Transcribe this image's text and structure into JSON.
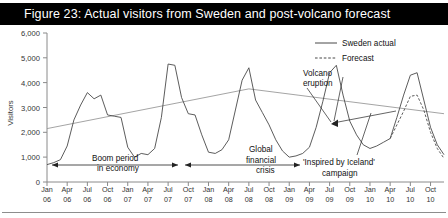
{
  "figure": {
    "title": "Figure 23: Actual visitors from Sweden and post-volcano forecast"
  },
  "chart_data": {
    "type": "line",
    "title": "Figure 23: Actual visitors from Sweden and post-volcano forecast",
    "xlabel": "",
    "ylabel": "Visitors",
    "ylim": [
      0,
      6000
    ],
    "yticks": [
      "0",
      "1,000",
      "2,000",
      "3,000",
      "4,000",
      "5,000",
      "6,000"
    ],
    "ytick_values": [
      0,
      1000,
      2000,
      3000,
      4000,
      5000,
      6000
    ],
    "grid": false,
    "legend_position": "top-right",
    "legend": [
      {
        "name": "Sweden actual",
        "style": "solid"
      },
      {
        "name": "Forecast",
        "style": "dashed"
      }
    ],
    "xtick_labels": [
      {
        "month": "Jan",
        "year": "06"
      },
      {
        "month": "Apr",
        "year": "06"
      },
      {
        "month": "Jul",
        "year": "06"
      },
      {
        "month": "Oct",
        "year": "06"
      },
      {
        "month": "Jan",
        "year": "07"
      },
      {
        "month": "Apr",
        "year": "07"
      },
      {
        "month": "Jul",
        "year": "07"
      },
      {
        "month": "Oct",
        "year": "07"
      },
      {
        "month": "Jan",
        "year": "08"
      },
      {
        "month": "Apr",
        "year": "08"
      },
      {
        "month": "Jul",
        "year": "08"
      },
      {
        "month": "Oct",
        "year": "08"
      },
      {
        "month": "Jan",
        "year": "09"
      },
      {
        "month": "Apr",
        "year": "09"
      },
      {
        "month": "Jul",
        "year": "09"
      },
      {
        "month": "Oct",
        "year": "09"
      },
      {
        "month": "Jan",
        "year": "10"
      },
      {
        "month": "Apr",
        "year": "10"
      },
      {
        "month": "Jul",
        "year": "10"
      },
      {
        "month": "Oct",
        "year": "10"
      }
    ],
    "x_start": "Jan 06",
    "x_end": "Dec 10",
    "series": [
      {
        "name": "Sweden actual",
        "style": "solid",
        "x": [
          "Jan 06",
          "Feb 06",
          "Mar 06",
          "Apr 06",
          "May 06",
          "Jun 06",
          "Jul 06",
          "Aug 06",
          "Sep 06",
          "Oct 06",
          "Nov 06",
          "Dec 06",
          "Jan 07",
          "Feb 07",
          "Mar 07",
          "Apr 07",
          "May 07",
          "Jun 07",
          "Jul 07",
          "Aug 07",
          "Sep 07",
          "Oct 07",
          "Nov 07",
          "Dec 07",
          "Jan 08",
          "Feb 08",
          "Mar 08",
          "Apr 08",
          "May 08",
          "Jun 08",
          "Jul 08",
          "Aug 08",
          "Sep 08",
          "Oct 08",
          "Nov 08",
          "Dec 08",
          "Jan 09",
          "Feb 09",
          "Mar 09",
          "Apr 09",
          "May 09",
          "Jun 09",
          "Jul 09",
          "Aug 09",
          "Sep 09",
          "Oct 09",
          "Nov 09",
          "Dec 09",
          "Jan 10",
          "Feb 10",
          "Mar 10",
          "Apr 10",
          "May 10",
          "Jun 10",
          "Jul 10",
          "Aug 10",
          "Sep 10",
          "Oct 10",
          "Nov 10",
          "Dec 10"
        ],
        "values": [
          700,
          780,
          900,
          1450,
          2500,
          3100,
          3600,
          3350,
          3500,
          2700,
          2650,
          2600,
          1400,
          1000,
          1150,
          1100,
          1350,
          2600,
          4750,
          4700,
          3400,
          2750,
          2700,
          1900,
          1200,
          1150,
          1300,
          1700,
          2900,
          4100,
          4600,
          3300,
          2800,
          2300,
          1700,
          1250,
          1000,
          1050,
          1150,
          1400,
          2200,
          3250,
          4400,
          4700,
          3500,
          2450,
          1900,
          1500,
          1350,
          1450,
          1600,
          1750,
          2600,
          3500,
          4300,
          4400,
          3300,
          2200,
          1500,
          1100
        ]
      },
      {
        "name": "Forecast",
        "style": "dashed",
        "x": [
          "Apr 10",
          "May 10",
          "Jun 10",
          "Jul 10",
          "Aug 10",
          "Sep 10",
          "Oct 10",
          "Nov 10",
          "Dec 10"
        ],
        "values": [
          1750,
          2300,
          2850,
          3450,
          3500,
          2900,
          2000,
          1350,
          950
        ]
      },
      {
        "name": "trend",
        "style": "solid-thin",
        "x": [
          "Jan 06",
          "Jul 08",
          "Dec 10"
        ],
        "values": [
          2150,
          3750,
          2750
        ]
      }
    ],
    "annotations": [
      {
        "id": "boom-period",
        "text_line1": "Boom period",
        "text_line2": "in economy",
        "arrow": "double"
      },
      {
        "id": "global-financial-crisis",
        "text_line1": "Global",
        "text_line2": "financial",
        "text_line3": "crisis",
        "arrow": "double"
      },
      {
        "id": "volcano-eruption",
        "text_line1": "Volcano",
        "text_line2": "eruption",
        "arrow": "leader"
      },
      {
        "id": "inspired-by-iceland",
        "text_line1": "'Inspired by Iceland'",
        "text_line2": "campaign",
        "arrow": "leader"
      }
    ]
  },
  "colors": {
    "banner_bg": "#000000",
    "banner_text": "#ffffff",
    "series_actual": "#3f3f3f",
    "series_forecast": "#3f3f3f",
    "trend_line": "#8a8a8a",
    "axis": "#8a8a8a",
    "text": "#222222"
  }
}
